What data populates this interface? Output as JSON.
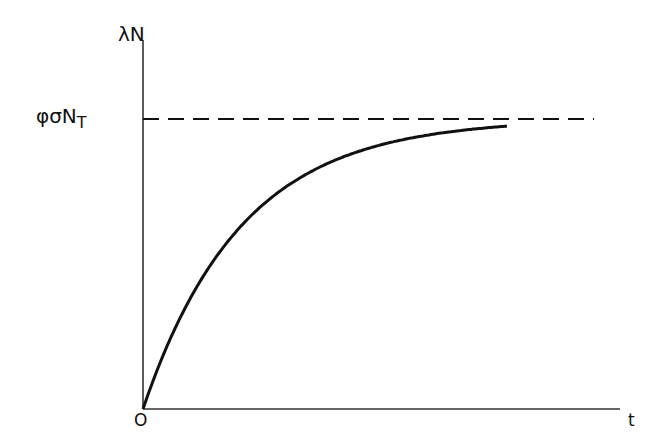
{
  "chart_data": {
    "type": "line",
    "title": "",
    "xlabel": "t",
    "ylabel": "λN",
    "origin_label": "O",
    "asymptote_label": "φσN_T",
    "asymptote_label_parts": {
      "main": "φσN",
      "sub": "T"
    },
    "grid": false,
    "legend": null,
    "series": [
      {
        "name": "λN(t) = φσN_T (1 − e^(−kt))",
        "style": "solid",
        "x": [
          0,
          0.05,
          0.1,
          0.2,
          0.3,
          0.4,
          0.5,
          0.6,
          0.7,
          0.8,
          0.9,
          1.0
        ],
        "y": [
          0,
          0.16,
          0.3,
          0.51,
          0.65,
          0.76,
          0.83,
          0.88,
          0.92,
          0.95,
          0.97,
          0.98
        ]
      },
      {
        "name": "asymptote φσN_T",
        "style": "dashed",
        "x": [
          0,
          1.2
        ],
        "y": [
          1,
          1
        ]
      }
    ],
    "xlim": [
      0,
      1.35
    ],
    "ylim": [
      0,
      1.26
    ],
    "annotations": [
      "λN",
      "φσN_T",
      "O",
      "t"
    ]
  },
  "labels": {
    "y_axis": "λN",
    "asymptote_main": "φσN",
    "asymptote_sub": "T",
    "origin": "O",
    "x_axis": "t"
  }
}
